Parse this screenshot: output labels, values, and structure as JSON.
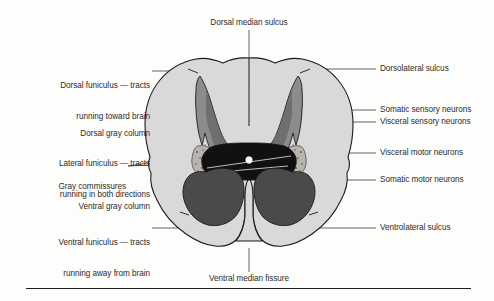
{
  "figure": {
    "colors": {
      "white_matter": "#d9d9d9",
      "dorsal_gray_column": "#8c8c8c",
      "ventral_gray_column": "#4a4a4a",
      "gray_commissure": "#111111",
      "lateral_horn_speckle": "#b5b0a8",
      "central_canal": "#ffffff",
      "outline": "#1a1a1a",
      "leader_line": "#3a3a3a",
      "text": "#2b2b2b",
      "background": "#fdfdfc"
    }
  },
  "labels": {
    "top": {
      "name": "dorsal-median-sulcus",
      "text": "Dorsal median sulcus"
    },
    "bottom": {
      "name": "ventral-median-fissure",
      "text": "Ventral median fissure"
    },
    "left": [
      {
        "name": "dorsal-funiculus",
        "line1": "Dorsal funiculus — tracts",
        "line2": "running toward brain"
      },
      {
        "name": "dorsal-gray-column",
        "line1": "Dorsal gray column",
        "line2": ""
      },
      {
        "name": "lateral-funiculus",
        "line1": "Lateral funiculus — tracts",
        "line2": "running in both directions"
      },
      {
        "name": "gray-commissures",
        "line1": "Gray commissures",
        "line2": ""
      },
      {
        "name": "ventral-gray-column",
        "line1": "Ventral gray column",
        "line2": ""
      },
      {
        "name": "ventral-funiculus",
        "line1": "Ventral funiculus — tracts",
        "line2": "running away from brain"
      }
    ],
    "right": [
      {
        "name": "dorsolateral-sulcus",
        "text": "Dorsolateral sulcus"
      },
      {
        "name": "somatic-sensory-neurons",
        "text": "Somatic sensory neurons"
      },
      {
        "name": "visceral-sensory-neurons",
        "text": "Visceral sensory neurons"
      },
      {
        "name": "visceral-motor-neurons",
        "text": "Visceral motor neurons"
      },
      {
        "name": "somatic-motor-neurons",
        "text": "Somatic motor neurons"
      },
      {
        "name": "ventrolateral-sulcus",
        "text": "Ventrolateral sulcus"
      }
    ]
  }
}
